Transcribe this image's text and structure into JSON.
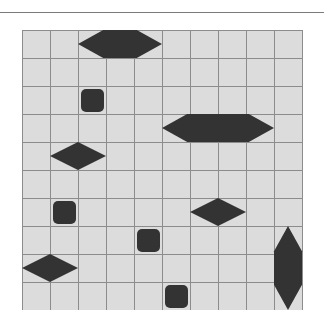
{
  "board": {
    "cols": 10,
    "rows": 10,
    "cell_px": 28,
    "colors": {
      "cell": "#dcdcdc",
      "grid_line": "#8c8c8c",
      "piece": "#333333"
    },
    "pieces": [
      {
        "id": "hexagon-top",
        "shape": "hexagon-horizontal",
        "x": 56,
        "y": 0,
        "w": 84,
        "h": 28
      },
      {
        "id": "square-1",
        "shape": "rounded-square",
        "col": 2,
        "row": 2
      },
      {
        "id": "hexagon-middle",
        "shape": "hexagon-horizontal",
        "x": 140,
        "y": 84,
        "w": 112,
        "h": 28
      },
      {
        "id": "diamond-1",
        "shape": "diamond",
        "x": 28,
        "y": 112,
        "w": 56,
        "h": 28
      },
      {
        "id": "square-2",
        "shape": "rounded-square",
        "col": 1,
        "row": 6
      },
      {
        "id": "diamond-2",
        "shape": "diamond",
        "x": 168,
        "y": 168,
        "w": 56,
        "h": 28
      },
      {
        "id": "square-3",
        "shape": "rounded-square",
        "col": 4,
        "row": 7
      },
      {
        "id": "diamond-3",
        "shape": "diamond",
        "x": 0,
        "y": 224,
        "w": 56,
        "h": 28
      },
      {
        "id": "hexagon-vertical",
        "shape": "hexagon-vertical",
        "x": 252,
        "y": 196,
        "w": 28,
        "h": 84
      },
      {
        "id": "square-4",
        "shape": "rounded-square",
        "col": 5,
        "row": 9
      }
    ]
  }
}
